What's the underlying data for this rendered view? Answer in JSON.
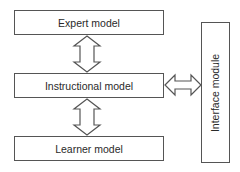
{
  "diagram": {
    "nodes": [
      {
        "id": "expert",
        "label": "Expert model"
      },
      {
        "id": "instructional",
        "label": "Instructional model"
      },
      {
        "id": "learner",
        "label": "Learner model"
      },
      {
        "id": "interface",
        "label": "Interface module"
      }
    ],
    "edges": [
      {
        "from": "expert",
        "to": "instructional",
        "type": "bidirectional"
      },
      {
        "from": "instructional",
        "to": "learner",
        "type": "bidirectional"
      },
      {
        "from": "instructional",
        "to": "interface",
        "type": "bidirectional"
      }
    ],
    "colors": {
      "stroke": "#555555",
      "text": "#2a2a2a",
      "background": "#ffffff"
    }
  }
}
